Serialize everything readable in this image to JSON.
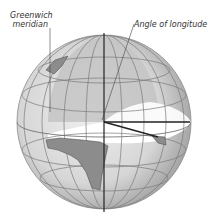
{
  "diagram": {
    "labels": {
      "greenwich_line1": "Greenwich",
      "greenwich_line2": "meridian",
      "angle_of_longitude": "Angle of longitude"
    },
    "colors": {
      "globe_fill": "#dcdcdc",
      "globe_shade": "#b4b4b4",
      "land": "#8c8c8c",
      "grid": "#7a7a7a",
      "axis": "#222222",
      "cutaway_plane": "#ffffff",
      "text": "#333333"
    }
  }
}
